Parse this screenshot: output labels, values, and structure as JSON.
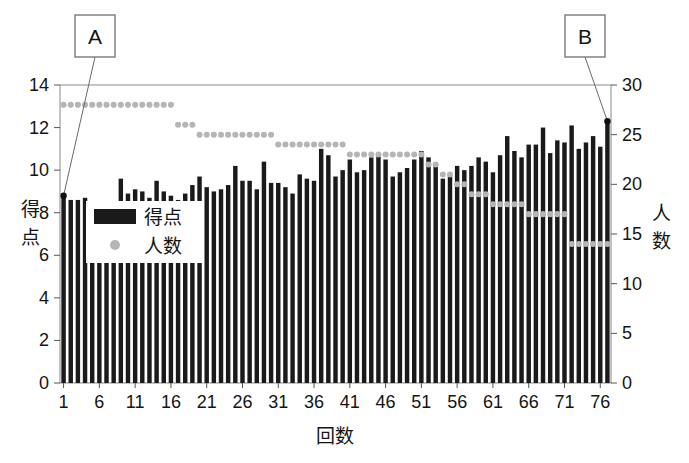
{
  "chart_data": {
    "type": "bar",
    "title": "",
    "xlabel": "回数",
    "ylabel": "得点",
    "ylabel_right": "人数",
    "xlim": [
      0.5,
      77.5
    ],
    "ylim": [
      0,
      14
    ],
    "ylim_right": [
      0,
      30
    ],
    "yticks": [
      0,
      2,
      4,
      6,
      8,
      10,
      12,
      14
    ],
    "yticks_right": [
      0,
      5,
      10,
      15,
      20,
      25,
      30
    ],
    "xticks": [
      1,
      6,
      11,
      16,
      21,
      26,
      31,
      36,
      41,
      46,
      51,
      56,
      61,
      66,
      71,
      76
    ],
    "grid": false,
    "legend_position": "upper-left-inside",
    "x": [
      1,
      2,
      3,
      4,
      5,
      6,
      7,
      8,
      9,
      10,
      11,
      12,
      13,
      14,
      15,
      16,
      17,
      18,
      19,
      20,
      21,
      22,
      23,
      24,
      25,
      26,
      27,
      28,
      29,
      30,
      31,
      32,
      33,
      34,
      35,
      36,
      37,
      38,
      39,
      40,
      41,
      42,
      43,
      44,
      45,
      46,
      47,
      48,
      49,
      50,
      51,
      52,
      53,
      54,
      55,
      56,
      57,
      58,
      59,
      60,
      61,
      62,
      63,
      64,
      65,
      66,
      67,
      68,
      69,
      70,
      71,
      72,
      73,
      74,
      75,
      76,
      77
    ],
    "series": [
      {
        "name": "得点",
        "type": "bar",
        "axis": "left",
        "color": "#1a1a1a",
        "values": [
          8.8,
          8.6,
          8.6,
          8.7,
          8.5,
          8.5,
          8.4,
          8.5,
          9.6,
          8.9,
          9.1,
          9.0,
          8.7,
          9.5,
          9.0,
          8.8,
          8.6,
          8.9,
          9.3,
          9.7,
          9.2,
          9.0,
          9.1,
          9.3,
          10.2,
          9.5,
          9.5,
          9.1,
          10.4,
          9.4,
          9.4,
          9.2,
          8.9,
          9.8,
          9.6,
          9.5,
          11.0,
          10.7,
          9.7,
          10.0,
          10.5,
          9.9,
          10.0,
          10.6,
          10.7,
          10.5,
          9.7,
          9.9,
          10.1,
          10.5,
          10.9,
          10.6,
          10.2,
          9.6,
          9.8,
          10.2,
          10.0,
          10.2,
          10.6,
          10.4,
          9.9,
          10.7,
          11.6,
          10.9,
          10.6,
          11.2,
          11.2,
          12.0,
          10.8,
          11.4,
          11.3,
          12.1,
          11.0,
          11.3,
          11.6,
          11.1,
          12.3
        ]
      },
      {
        "name": "人数",
        "type": "scatter",
        "axis": "right",
        "color": "#b5b5b5",
        "values": [
          28,
          28,
          28,
          28,
          28,
          28,
          28,
          28,
          28,
          28,
          28,
          28,
          28,
          28,
          28,
          28,
          26,
          26,
          26,
          25,
          25,
          25,
          25,
          25,
          25,
          25,
          25,
          25,
          25,
          25,
          24,
          24,
          24,
          24,
          24,
          24,
          24,
          24,
          24,
          24,
          23,
          23,
          23,
          23,
          23,
          23,
          23,
          23,
          23,
          23,
          23,
          22,
          22,
          21,
          21,
          20,
          20,
          19,
          19,
          19,
          18,
          18,
          18,
          18,
          18,
          17,
          17,
          17,
          17,
          17,
          17,
          14,
          14,
          14,
          14,
          14,
          14
        ]
      }
    ]
  },
  "legend": {
    "items": [
      {
        "label": "得点",
        "marker": "bar",
        "color": "#1a1a1a"
      },
      {
        "label": "人数",
        "marker": "dot",
        "color": "#b5b5b5"
      }
    ]
  },
  "callouts": [
    {
      "id": "callout-a",
      "label": "A",
      "target_x": 1,
      "target_y": 8.8
    },
    {
      "id": "callout-b",
      "label": "B",
      "target_x": 77,
      "target_y": 12.3
    }
  ],
  "colors": {
    "bar": "#1a1a1a",
    "dot": "#b5b5b5",
    "axis": "#555555",
    "text": "#151515",
    "background": "#ffffff"
  }
}
